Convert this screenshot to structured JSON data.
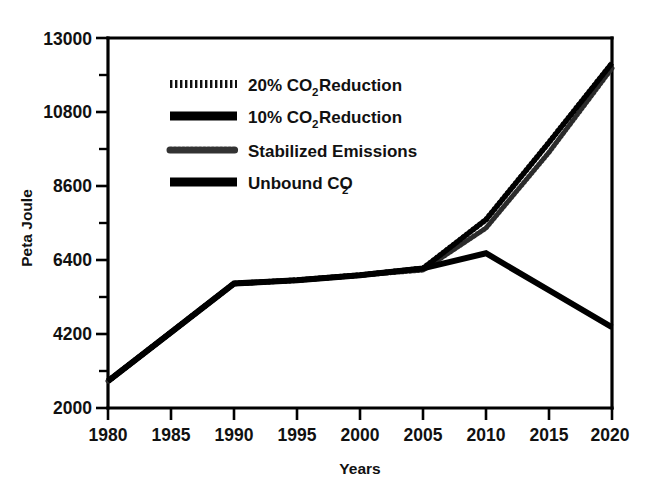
{
  "chart_data": {
    "type": "line",
    "title": "",
    "xlabel": "Years",
    "ylabel": "Peta Joule",
    "xlim": [
      1980,
      2020
    ],
    "ylim": [
      2000,
      13000
    ],
    "x_ticks": [
      "1980",
      "1985",
      "1990",
      "1995",
      "2000",
      "2005",
      "2010",
      "2015",
      "2020"
    ],
    "y_ticks": [
      "2000",
      "4200",
      "6400",
      "8600",
      "10800",
      "13000"
    ],
    "y_minor_ticks": [
      3100,
      5300,
      7500,
      9700,
      11900
    ],
    "grid": false,
    "legend_position": "upper-left-inside",
    "x": [
      1980,
      1985,
      1990,
      1995,
      2000,
      2005,
      2010,
      2015,
      2020
    ],
    "series": [
      {
        "name": "20% CO2 Reduction",
        "label_main": "20% CO",
        "label_sub": "2",
        "label_tail": " Reduction",
        "style": "hatched",
        "values": [
          2800,
          4250,
          5700,
          5800,
          5950,
          6150,
          7600,
          9900,
          12250
        ]
      },
      {
        "name": "10% CO2 Reduction",
        "label_main": "10% CO",
        "label_sub": "2",
        "label_tail": " Reduction",
        "style": "solid-thick",
        "values": [
          2800,
          4250,
          5700,
          5800,
          5950,
          6150,
          7600,
          9900,
          12250
        ]
      },
      {
        "name": "Stabilized Emissions",
        "label_main": "Stabilized Emissions",
        "label_sub": "",
        "label_tail": "",
        "style": "dotted",
        "values": [
          2800,
          4250,
          5700,
          5800,
          5950,
          6100,
          7350,
          9600,
          12100
        ]
      },
      {
        "name": "Unbound CO2",
        "label_main": "Unbound CO",
        "label_sub": "2",
        "label_tail": "",
        "style": "solid-thick",
        "values": [
          2800,
          4250,
          5700,
          5800,
          5950,
          6150,
          6600,
          5500,
          4400
        ]
      }
    ]
  },
  "axes": {
    "y_title": "Peta Joule",
    "x_title": "Years"
  },
  "legend": {
    "entries": [
      {
        "swatch": "hatched-line-swatch",
        "main": "20% CO",
        "sub": "2",
        "tail": " Reduction"
      },
      {
        "swatch": "solid-line-swatch",
        "main": "10% CO",
        "sub": "2",
        "tail": " Reduction"
      },
      {
        "swatch": "dotted-line-swatch",
        "main": "Stabilized Emissions",
        "sub": "",
        "tail": ""
      },
      {
        "swatch": "solid-line-swatch",
        "main": "Unbound CO",
        "sub": "2",
        "tail": ""
      }
    ]
  },
  "colors": {
    "background": "#ffffff",
    "foreground": "#000000",
    "series_ink": "#1a1a1a"
  }
}
